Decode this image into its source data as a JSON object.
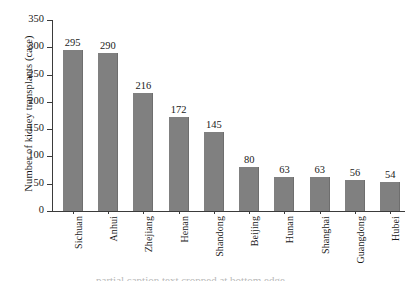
{
  "chart_data": {
    "type": "bar",
    "title": "",
    "subtitle": "",
    "xlabel": "",
    "ylabel": "Number of kidney transplants (case)",
    "categories": [
      "Sichuan",
      "Anhui",
      "Zhejiang",
      "Henan",
      "Shandong",
      "Beijing",
      "Hunan",
      "Shanghai",
      "Guangdong",
      "Hubei"
    ],
    "values": [
      295,
      290,
      216,
      172,
      145,
      80,
      63,
      63,
      56,
      54
    ],
    "value_labels": [
      "295",
      "290",
      "216",
      "172",
      "145",
      "80",
      "63",
      "63",
      "56",
      "54"
    ],
    "ylim": [
      0,
      350
    ],
    "yticks": [
      0,
      50,
      100,
      150,
      200,
      250,
      300,
      350
    ],
    "ytick_labels": [
      "0",
      "50",
      "100",
      "150",
      "200",
      "250",
      "300",
      "350"
    ],
    "grid": false,
    "legend": null,
    "legend_position": "none",
    "bar_color": "#808080",
    "axis_color": "#3b3b3b",
    "text_color": "#1a1a1a",
    "background": "#ffffff",
    "xtick_rotation": -90
  },
  "caption_sliver": "partial caption text cropped at bottom edge"
}
